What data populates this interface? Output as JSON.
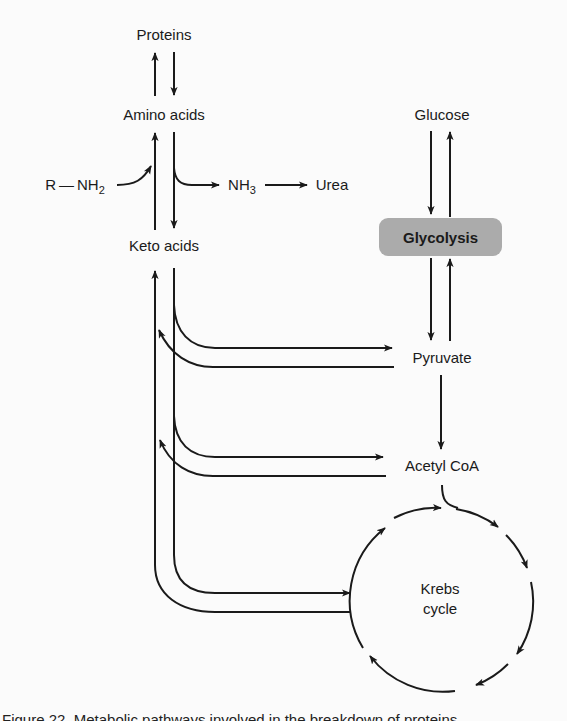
{
  "diagram": {
    "nodes": {
      "proteins": "Proteins",
      "amino_acids": "Amino acids",
      "r_nh2_prefix": "R — NH",
      "r_nh2_sub": "2",
      "nh3_prefix": "NH",
      "nh3_sub": "3",
      "urea": "Urea",
      "keto_acids": "Keto acids",
      "glucose": "Glucose",
      "glycolysis": "Glycolysis",
      "pyruvate": "Pyruvate",
      "acetyl_coa": "Acetyl CoA",
      "krebs_line1": "Krebs",
      "krebs_line2": "cycle"
    },
    "edges": [
      {
        "from": "Amino acids",
        "to": "Proteins"
      },
      {
        "from": "Proteins",
        "to": "Amino acids"
      },
      {
        "from": "Keto acids",
        "to": "Amino acids"
      },
      {
        "from": "R-NH2",
        "to": "Amino acids"
      },
      {
        "from": "Amino acids",
        "to": "Keto acids"
      },
      {
        "from": "Amino acids",
        "to": "NH3"
      },
      {
        "from": "NH3",
        "to": "Urea"
      },
      {
        "from": "Glucose",
        "to": "Glycolysis"
      },
      {
        "from": "Glycolysis",
        "to": "Glucose"
      },
      {
        "from": "Glycolysis",
        "to": "Pyruvate"
      },
      {
        "from": "Pyruvate",
        "to": "Glycolysis"
      },
      {
        "from": "Keto acids",
        "to": "Pyruvate"
      },
      {
        "from": "Pyruvate",
        "to": "Keto acids"
      },
      {
        "from": "Pyruvate",
        "to": "Acetyl CoA"
      },
      {
        "from": "Keto acids",
        "to": "Acetyl CoA"
      },
      {
        "from": "Acetyl CoA",
        "to": "Keto acids"
      },
      {
        "from": "Acetyl CoA",
        "to": "Krebs cycle"
      },
      {
        "from": "Keto acids",
        "to": "Krebs cycle"
      },
      {
        "from": "Krebs cycle",
        "to": "Keto acids"
      }
    ],
    "colors": {
      "line": "#1a1a1a",
      "box_fill": "#ababab",
      "background": "#fbfbfb"
    }
  },
  "caption": {
    "text": "Figure 22. Metabolic pathways involved in the breakdown of proteins"
  }
}
